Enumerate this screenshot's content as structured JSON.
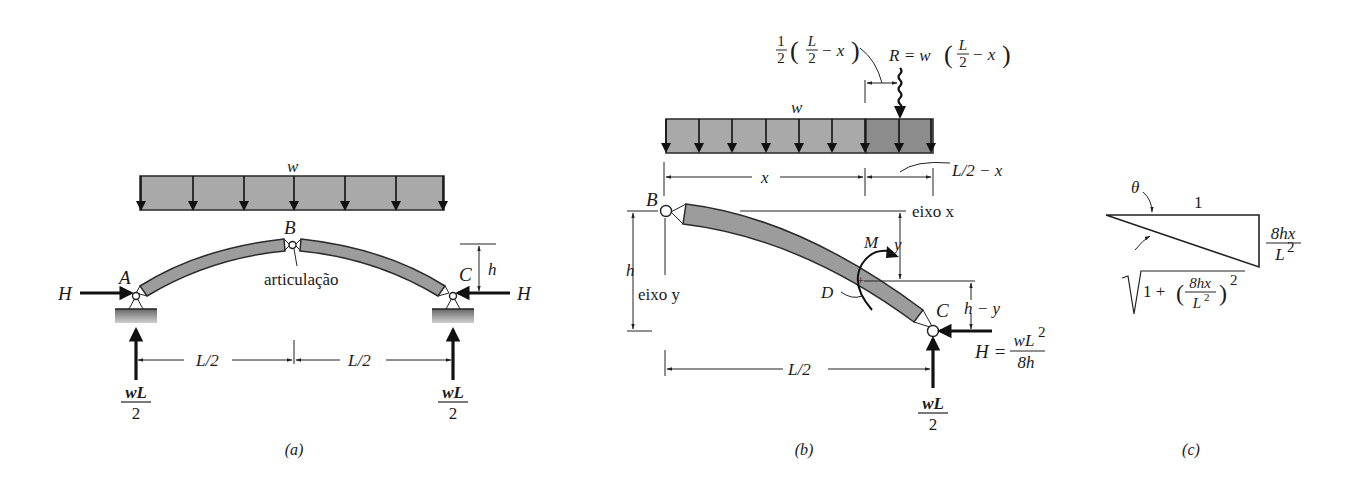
{
  "figure": {
    "panels": [
      {
        "id": "a",
        "caption": "(a)",
        "labels": {
          "load": "w",
          "support_left": "A",
          "crown": "B",
          "support_right": "C",
          "hinge": "articulação",
          "thrust_left": "H",
          "thrust_right": "H",
          "rise": "h",
          "span_left": "L/2",
          "span_right": "L/2",
          "reaction_left_num": "wL",
          "reaction_left_den": "2",
          "reaction_right_num": "wL",
          "reaction_right_den": "2"
        }
      },
      {
        "id": "b",
        "caption": "(b)",
        "labels": {
          "load": "w",
          "lever_frac_num": "1",
          "lever_frac_den": "2",
          "lever_inner_num": "L",
          "lever_inner_den": "2",
          "lever_tail": "− x",
          "resultant_prefix": "R = w",
          "resultant_num": "L",
          "resultant_den": "2",
          "resultant_tail": "− x",
          "dim_x": "x",
          "dim_remaining": "L/2 − x",
          "crown": "B",
          "axis_x": "eixo x",
          "axis_y": "eixo y",
          "rise": "h",
          "ordinate": "y",
          "moment": "M",
          "section": "D",
          "support": "C",
          "h_minus_y": "h − y",
          "thrust_prefix": "H =",
          "thrust_num": "wL",
          "thrust_num_sup": "2",
          "thrust_den": "8h",
          "span": "L/2",
          "reaction_num": "wL",
          "reaction_den": "2"
        }
      },
      {
        "id": "c",
        "caption": "(c)",
        "labels": {
          "angle": "θ",
          "adjacent": "1",
          "opposite_num": "8hx",
          "opposite_den": "L",
          "opposite_den_sup": "2",
          "hyp_prefix": "1 +",
          "hyp_num": "8hx",
          "hyp_den": "L",
          "hyp_den_sup": "2",
          "hyp_exp": "2"
        }
      }
    ],
    "colors": {
      "load_fill": "#a9a9a9",
      "load_fill_dark": "#8c8c8c",
      "member_fill": "#9c9c9c",
      "stroke": "#222222",
      "background": "#ffffff"
    }
  }
}
